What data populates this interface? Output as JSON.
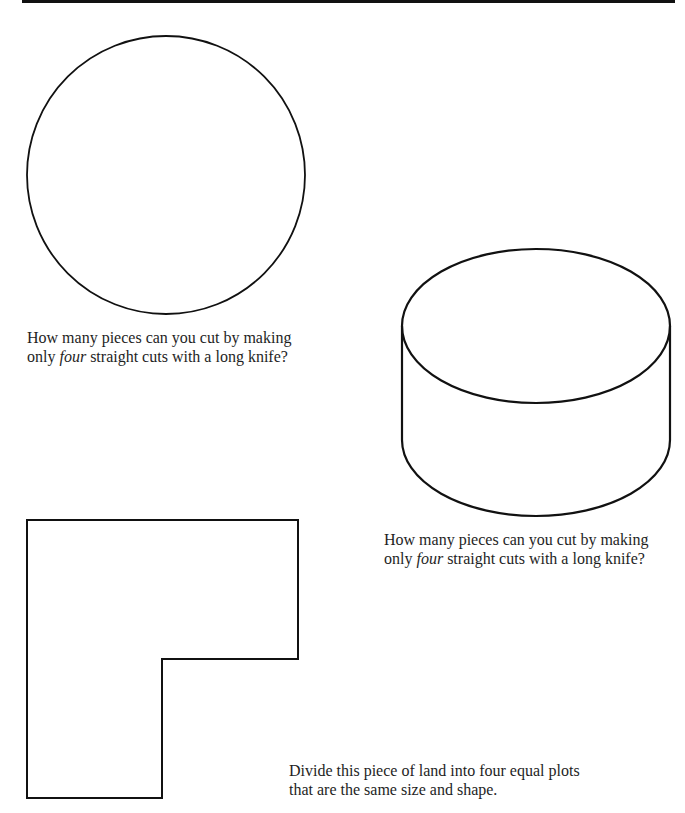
{
  "page": {
    "puzzles": [
      {
        "figure": "circle",
        "caption_line1": "How many pieces can you cut by making",
        "caption_line2_pre": "only ",
        "caption_line2_em": "four",
        "caption_line2_post": " straight cuts with a long knife?"
      },
      {
        "figure": "cylinder",
        "caption_line1": "How many pieces can you cut by making",
        "caption_line2_pre": "only ",
        "caption_line2_em": "four",
        "caption_line2_post": " straight cuts with a long knife?"
      },
      {
        "figure": "l-shaped-land",
        "caption_line1": "Divide this piece of land into four equal plots",
        "caption_line2": "that are the same size and shape."
      }
    ],
    "colors": {
      "stroke": "#111111",
      "text": "#1e1e1e",
      "background": "#ffffff"
    }
  }
}
